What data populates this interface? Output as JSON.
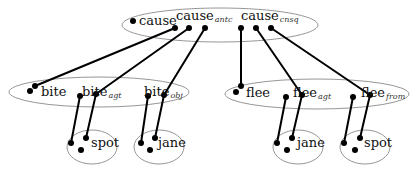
{
  "diagram": {
    "top_group": {
      "labels": [
        {
          "base": "cause",
          "sub": ""
        },
        {
          "base": "cause",
          "sub": "antc"
        },
        {
          "base": "cause",
          "sub": "cnsq"
        }
      ]
    },
    "left_group": {
      "labels": [
        {
          "base": "bite",
          "sub": ""
        },
        {
          "base": "bite",
          "sub": "agt"
        },
        {
          "base": "bite",
          "sub": "obj"
        }
      ]
    },
    "right_group": {
      "labels": [
        {
          "base": "flee",
          "sub": ""
        },
        {
          "base": "flee",
          "sub": "agt"
        },
        {
          "base": "flee",
          "sub": "from"
        }
      ]
    },
    "leaf_groups": [
      {
        "label": "spot"
      },
      {
        "label": "jane"
      },
      {
        "label": "jane"
      },
      {
        "label": "spot"
      }
    ]
  }
}
